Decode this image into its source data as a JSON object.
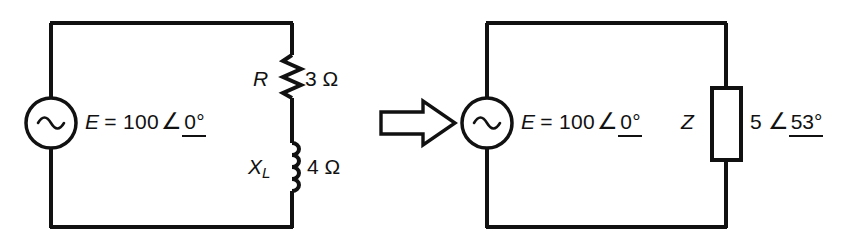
{
  "figure": {
    "type": "circuit-diagram",
    "background": "#ffffff",
    "line_color": "#111111"
  },
  "left_circuit": {
    "name": "series RL circuit",
    "source": {
      "symbol": "ac-source-sine",
      "label_e": "E",
      "label_eq": "= 100",
      "angle_symbol": "∠",
      "angle_value": "0°"
    },
    "resistor": {
      "symbol": "resistor-zigzag",
      "label": "R",
      "value": "3 Ω"
    },
    "inductor": {
      "symbol": "inductor-coil",
      "label": "X",
      "label_sub": "L",
      "value": "4 Ω"
    }
  },
  "arrow": {
    "symbol": "block-arrow-right",
    "direction": "right"
  },
  "right_circuit": {
    "name": "equivalent impedance circuit",
    "source": {
      "symbol": "ac-source-sine",
      "label_e": "E",
      "label_eq": "= 100",
      "angle_symbol": "∠",
      "angle_value": "0°"
    },
    "impedance": {
      "symbol": "impedance-box",
      "label": "Z",
      "magnitude": "5",
      "angle_symbol": "∠",
      "angle_value": "53°"
    }
  }
}
